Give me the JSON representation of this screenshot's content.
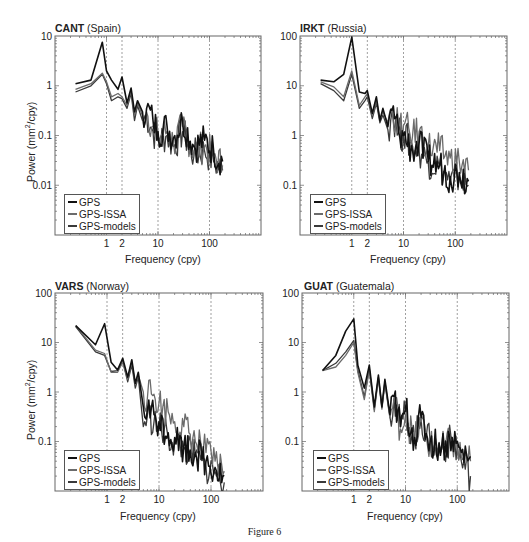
{
  "figure": {
    "caption": "Figure 6"
  },
  "chart_data": [
    {
      "type": "line",
      "scale": "log-log",
      "title": "CANT (Spain)",
      "station": "CANT",
      "country": "(Spain)",
      "xlabel": "Frequency (cpy)",
      "ylabel": "Power (mm²/cpy)",
      "xlim": [
        0.1,
        1000
      ],
      "ylim": [
        0.001,
        10
      ],
      "xticks": [
        "1",
        "2",
        "10",
        "100"
      ],
      "yticks": [
        "10",
        "1",
        "0.1",
        "0.01"
      ],
      "vlines": [
        1,
        2,
        10,
        100
      ],
      "grid": false,
      "legend": [
        "GPS",
        "GPS-ISSA",
        "GPS-models"
      ],
      "legend_position": "lower left",
      "series": [
        {
          "name": "GPS",
          "color": "#111111",
          "x": [
            0.25,
            0.5,
            0.83,
            1.0,
            1.25,
            1.67,
            2.0,
            2.5,
            3.0,
            3.5,
            4.0,
            5.0,
            6.0,
            8.0,
            10,
            15,
            20,
            30,
            50,
            80,
            120,
            180
          ],
          "y": [
            1.1,
            1.3,
            7.5,
            2.0,
            1.3,
            0.85,
            1.5,
            0.45,
            0.9,
            0.3,
            0.5,
            0.3,
            0.35,
            0.2,
            0.12,
            0.15,
            0.09,
            0.2,
            0.06,
            0.08,
            0.05,
            0.03
          ]
        },
        {
          "name": "GPS-ISSA",
          "color": "#6b6b6b",
          "x": [
            0.25,
            0.5,
            0.83,
            1.0,
            1.25,
            1.67,
            2.0,
            2.5,
            3.0,
            3.5,
            4.0,
            5.0,
            6.0,
            8.0,
            10,
            15,
            20,
            30,
            50,
            80,
            120,
            180
          ],
          "y": [
            0.85,
            1.1,
            1.8,
            1.2,
            0.6,
            0.7,
            0.6,
            0.4,
            0.8,
            0.25,
            0.45,
            0.25,
            0.3,
            0.15,
            0.1,
            0.12,
            0.07,
            0.15,
            0.05,
            0.06,
            0.04,
            0.025
          ]
        },
        {
          "name": "GPS-models",
          "color": "#3a3a3a",
          "x": [
            0.25,
            0.5,
            0.83,
            1.0,
            1.25,
            1.67,
            2.0,
            2.5,
            3.0,
            3.5,
            4.0,
            5.0,
            6.0,
            8.0,
            10,
            15,
            20,
            30,
            50,
            80,
            120,
            180
          ],
          "y": [
            0.75,
            1.0,
            1.7,
            1.1,
            0.5,
            0.6,
            0.55,
            0.35,
            0.7,
            0.2,
            0.4,
            0.2,
            0.25,
            0.12,
            0.08,
            0.1,
            0.06,
            0.12,
            0.04,
            0.05,
            0.03,
            0.02
          ]
        }
      ]
    },
    {
      "type": "line",
      "scale": "log-log",
      "title": "IRKT (Russia)",
      "station": "IRKT",
      "country": "(Russia)",
      "xlabel": "",
      "ylabel": "",
      "xlim": [
        0.1,
        1000
      ],
      "ylim": [
        0.01,
        100
      ],
      "xticks": [
        "1",
        "2",
        "10",
        "100"
      ],
      "yticks": [
        "100",
        "10",
        "1",
        "0.1"
      ],
      "vlines": [
        1,
        2,
        10,
        100
      ],
      "grid": false,
      "legend": [
        "GPS",
        "GPS-ISSA",
        "GPS-models"
      ],
      "legend_position": "lower left",
      "series": [
        {
          "name": "GPS",
          "color": "#111111",
          "x": [
            0.25,
            0.45,
            0.7,
            1.0,
            1.4,
            1.8,
            2.0,
            2.5,
            3.0,
            3.5,
            4.0,
            5.0,
            6.0,
            8.0,
            10,
            15,
            20,
            30,
            50,
            80,
            120,
            180
          ],
          "y": [
            13,
            12,
            17,
            95,
            7.5,
            7,
            8,
            2.8,
            6,
            2.0,
            3.5,
            1.5,
            3.2,
            1.2,
            1.0,
            0.5,
            0.7,
            0.3,
            0.25,
            0.15,
            0.18,
            0.12
          ]
        },
        {
          "name": "GPS-ISSA",
          "color": "#6b6b6b",
          "x": [
            0.25,
            0.45,
            0.7,
            1.0,
            1.4,
            1.8,
            2.0,
            2.5,
            3.0,
            3.5,
            4.0,
            5.0,
            6.0,
            8.0,
            10,
            15,
            20,
            30,
            50,
            80,
            120,
            180
          ],
          "y": [
            12,
            9.5,
            6,
            20,
            4,
            6,
            7,
            2.5,
            5,
            2.2,
            3.0,
            1.8,
            3.5,
            1.5,
            1.6,
            1.0,
            1.2,
            0.6,
            0.5,
            0.35,
            0.3,
            0.2
          ]
        },
        {
          "name": "GPS-models",
          "color": "#3a3a3a",
          "x": [
            0.25,
            0.45,
            0.7,
            1.0,
            1.4,
            1.8,
            2.0,
            2.5,
            3.0,
            3.5,
            4.0,
            5.0,
            6.0,
            8.0,
            10,
            15,
            20,
            30,
            50,
            80,
            120,
            180
          ],
          "y": [
            11,
            8,
            5,
            17,
            3.5,
            5,
            6,
            2.2,
            4.5,
            1.8,
            2.6,
            1.3,
            3.0,
            1.1,
            1.0,
            0.6,
            0.5,
            0.3,
            0.25,
            0.12,
            0.15,
            0.1
          ]
        }
      ]
    },
    {
      "type": "line",
      "scale": "log-log",
      "title": "VARS (Norway)",
      "station": "VARS",
      "country": "(Norway)",
      "xlabel": "Frequency (cpy)",
      "ylabel": "Power (mm²/cpy)",
      "xlim": [
        0.1,
        1000
      ],
      "ylim": [
        0.01,
        100
      ],
      "xticks": [
        "1",
        "2",
        "10",
        "100"
      ],
      "yticks": [
        "100",
        "10",
        "1",
        "0.1"
      ],
      "vlines": [
        1,
        2,
        10,
        100
      ],
      "grid": false,
      "legend": [
        "GPS",
        "GPS-ISSA",
        "GPS-models"
      ],
      "legend_position": "lower left",
      "series": [
        {
          "name": "GPS",
          "color": "#111111",
          "x": [
            0.25,
            0.6,
            0.9,
            1.2,
            1.6,
            2.0,
            2.5,
            3.0,
            3.5,
            4.0,
            5.0,
            6.0,
            8.0,
            10,
            15,
            20,
            30,
            50,
            80,
            120,
            180
          ],
          "y": [
            22,
            9,
            24,
            4,
            2.8,
            4.8,
            2.0,
            4.5,
            1.5,
            2.5,
            0.5,
            0.45,
            0.35,
            0.25,
            0.15,
            0.12,
            0.08,
            0.06,
            0.04,
            0.03,
            0.02
          ]
        },
        {
          "name": "GPS-ISSA",
          "color": "#6b6b6b",
          "x": [
            0.25,
            0.6,
            0.9,
            1.2,
            1.6,
            2.0,
            2.5,
            3.0,
            3.5,
            4.0,
            5.0,
            6.0,
            8.0,
            10,
            15,
            20,
            30,
            50,
            80,
            120,
            180
          ],
          "y": [
            22,
            7,
            6,
            2.5,
            2.5,
            4.0,
            1.8,
            4.0,
            1.4,
            2.2,
            1.0,
            0.8,
            0.9,
            0.6,
            0.4,
            0.25,
            0.2,
            0.1,
            0.06,
            0.04,
            0.025
          ]
        },
        {
          "name": "GPS-models",
          "color": "#3a3a3a",
          "x": [
            0.25,
            0.6,
            0.9,
            1.2,
            1.6,
            2.0,
            2.5,
            3.0,
            3.5,
            4.0,
            5.0,
            6.0,
            8.0,
            10,
            15,
            20,
            30,
            50,
            80,
            120,
            180
          ],
          "y": [
            21,
            6.5,
            5.5,
            2.6,
            2.7,
            4.2,
            1.6,
            3.5,
            1.2,
            2.0,
            0.2,
            0.35,
            0.25,
            0.2,
            0.12,
            0.1,
            0.07,
            0.05,
            0.03,
            0.025,
            0.015
          ]
        }
      ]
    },
    {
      "type": "line",
      "scale": "log-log",
      "title": "GUAT (Guatemala)",
      "station": "GUAT",
      "country": "(Guatemala)",
      "xlabel": "",
      "ylabel": "",
      "xlim": [
        0.1,
        1000
      ],
      "ylim": [
        0.01,
        100
      ],
      "xticks": [
        "1",
        "2",
        "10",
        "100"
      ],
      "yticks": [
        "100",
        "10",
        "1",
        "0.1"
      ],
      "vlines": [
        1,
        2,
        10,
        100
      ],
      "grid": false,
      "legend": [
        "GPS",
        "GPS-ISSA",
        "GPS-models"
      ],
      "legend_position": "lower left",
      "series": [
        {
          "name": "GPS",
          "color": "#111111",
          "x": [
            0.25,
            0.45,
            0.7,
            1.0,
            1.2,
            1.6,
            2.0,
            2.5,
            3.0,
            3.5,
            4.0,
            5.0,
            6.0,
            8.0,
            10,
            15,
            20,
            30,
            50,
            80,
            120,
            180
          ],
          "y": [
            2.7,
            5.5,
            17,
            30,
            3.5,
            1.2,
            3.5,
            0.5,
            2.2,
            0.5,
            1.8,
            0.35,
            0.8,
            0.2,
            0.45,
            0.12,
            0.3,
            0.1,
            0.08,
            0.12,
            0.06,
            0.05
          ]
        },
        {
          "name": "GPS-ISSA",
          "color": "#6b6b6b",
          "x": [
            0.25,
            0.45,
            0.7,
            1.0,
            1.2,
            1.6,
            2.0,
            2.5,
            3.0,
            3.5,
            4.0,
            5.0,
            6.0,
            8.0,
            10,
            15,
            20,
            30,
            50,
            80,
            120,
            180
          ],
          "y": [
            2.7,
            3.2,
            5.5,
            10,
            2.5,
            0.7,
            2.8,
            0.4,
            1.9,
            0.45,
            1.5,
            0.3,
            0.7,
            0.18,
            0.35,
            0.1,
            0.25,
            0.08,
            0.07,
            0.1,
            0.05,
            0.04
          ]
        },
        {
          "name": "GPS-models",
          "color": "#3a3a3a",
          "x": [
            0.25,
            0.45,
            0.7,
            1.0,
            1.2,
            1.6,
            2.0,
            2.5,
            3.0,
            3.5,
            4.0,
            5.0,
            6.0,
            8.0,
            10,
            15,
            20,
            30,
            50,
            80,
            120,
            180
          ],
          "y": [
            2.7,
            3.8,
            6.5,
            11,
            2.8,
            0.8,
            3.0,
            0.45,
            2.0,
            0.5,
            1.6,
            0.32,
            0.75,
            0.2,
            0.4,
            0.11,
            0.28,
            0.09,
            0.07,
            0.11,
            0.04,
            0.02
          ]
        }
      ]
    }
  ]
}
